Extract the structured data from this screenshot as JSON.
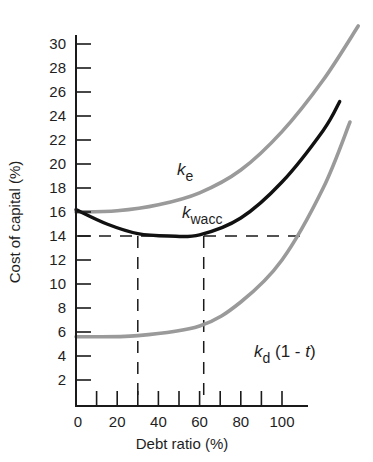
{
  "chart_data": {
    "type": "line",
    "title": "",
    "xlabel": "Debt ratio (%)",
    "ylabel": "Cost of capital (%)",
    "xlim": [
      0,
      140
    ],
    "ylim": [
      0,
      31
    ],
    "x_ticks": [
      0,
      20,
      40,
      60,
      80,
      100
    ],
    "x_minor_ticks": [
      10,
      30,
      50,
      70,
      90
    ],
    "y_ticks": [
      2,
      4,
      6,
      8,
      10,
      12,
      14,
      16,
      18,
      20,
      22,
      24,
      26,
      28,
      30
    ],
    "grid": false,
    "legend": "inline labels",
    "series": [
      {
        "name": "k_e",
        "label_main": "k",
        "label_sub": "e",
        "color": "#9a9a9a",
        "x": [
          0,
          20,
          40,
          60,
          80,
          100,
          120,
          137
        ],
        "values": [
          16.0,
          16.1,
          16.6,
          17.6,
          19.5,
          22.7,
          27.0,
          31.5
        ]
      },
      {
        "name": "k_wacc",
        "label_main": "k",
        "label_sub": "wacc",
        "color": "#111111",
        "x": [
          0,
          15,
          30,
          45,
          60,
          80,
          100,
          120,
          128
        ],
        "values": [
          16.2,
          15.0,
          14.2,
          14.0,
          14.1,
          15.5,
          18.5,
          22.8,
          25.2
        ]
      },
      {
        "name": "k_d (1 - t)",
        "label_main": "k",
        "label_sub": "d",
        "label_suffix": " (1 - ",
        "label_t": "t",
        "label_close": ")",
        "color": "#9a9a9a",
        "x": [
          0,
          30,
          60,
          80,
          100,
          120,
          133
        ],
        "values": [
          5.6,
          5.7,
          6.5,
          8.5,
          12.0,
          18.0,
          23.5
        ]
      }
    ],
    "annotations": [
      {
        "type": "dashed-hline",
        "y": 14,
        "x_from": 0,
        "x_to": 112
      },
      {
        "type": "dashed-vline",
        "x": 30,
        "y_from": 0,
        "y_to": 14
      },
      {
        "type": "dashed-vline",
        "x": 62,
        "y_from": 0,
        "y_to": 14
      }
    ]
  },
  "axes": {
    "x_title": "Debt ratio (%)",
    "y_title": "Cost of capital (%)"
  }
}
